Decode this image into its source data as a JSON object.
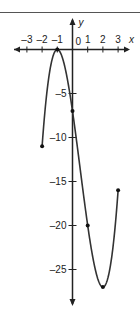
{
  "chart_data": {
    "type": "line",
    "title": "",
    "xlabel": "x",
    "ylabel": "y",
    "xlim": [
      -3.5,
      3.5
    ],
    "ylim": [
      -29,
      3
    ],
    "x_ticks": [
      "-3",
      "-2",
      "-1",
      "0",
      "1",
      "2",
      "3"
    ],
    "y_ticks": [
      "-5",
      "-10",
      "-15",
      "-20",
      "-25"
    ],
    "grid": false,
    "series": [
      {
        "name": "f(x)",
        "function": "2x^3 - 3x^2 - 12x - 7",
        "domain": [
          -2,
          3
        ],
        "marked_points": [
          {
            "x": -2,
            "y": -11
          },
          {
            "x": -1,
            "y": 0
          },
          {
            "x": 0,
            "y": -7
          },
          {
            "x": 1,
            "y": -20
          },
          {
            "x": 2,
            "y": -27
          },
          {
            "x": 3,
            "y": -16
          }
        ]
      }
    ]
  },
  "labels": {
    "x_axis": "x",
    "y_axis": "y",
    "origin": "0",
    "xt": [
      "-3",
      "-2",
      "-1",
      "1",
      "2",
      "3"
    ],
    "yt": [
      "-5",
      "-10",
      "-15",
      "-20",
      "-25"
    ]
  }
}
